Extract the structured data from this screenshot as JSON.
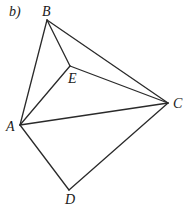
{
  "figure": {
    "label": "b)",
    "vertices": [
      {
        "id": "B",
        "label": "B",
        "x": 47,
        "y": 20,
        "lx": 42,
        "ly": 16
      },
      {
        "id": "E",
        "label": "E",
        "x": 70,
        "y": 66,
        "lx": 68,
        "ly": 83
      },
      {
        "id": "C",
        "label": "C",
        "x": 168,
        "y": 103,
        "lx": 173,
        "ly": 108
      },
      {
        "id": "A",
        "label": "A",
        "x": 20,
        "y": 125,
        "lx": 6,
        "ly": 131
      },
      {
        "id": "D",
        "label": "D",
        "x": 69,
        "y": 190,
        "lx": 65,
        "ly": 204
      }
    ],
    "edges": [
      [
        "B",
        "A"
      ],
      [
        "B",
        "E"
      ],
      [
        "B",
        "C"
      ],
      [
        "E",
        "A"
      ],
      [
        "E",
        "C"
      ],
      [
        "A",
        "C"
      ],
      [
        "A",
        "D"
      ],
      [
        "D",
        "C"
      ]
    ]
  }
}
